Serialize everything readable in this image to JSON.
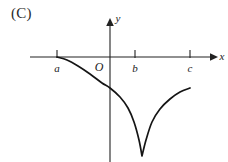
{
  "figure": {
    "choice_label": "(C)",
    "origin_label": "O",
    "x_axis_label": "x",
    "y_axis_label": "y",
    "line_color": "#151515",
    "axis_color": "#222222",
    "background_color": "#ffffff"
  },
  "ticks": {
    "x": [
      {
        "label": "a",
        "px": 57
      },
      {
        "label": "b",
        "px": 135
      },
      {
        "label": "c",
        "px": 190
      }
    ]
  },
  "chart_data": {
    "type": "line",
    "title": "",
    "xlabel": "x",
    "ylabel": "y",
    "grid": false,
    "legend": null,
    "annotations": [
      "(C)",
      "O"
    ],
    "xticks": [
      "a",
      "b",
      "c"
    ],
    "yticks": [],
    "xlim": [
      30,
      215
    ],
    "ylim": [
      162,
      20
    ],
    "series": [
      {
        "name": "curve",
        "points": [
          [
            57,
            57
          ],
          [
            67,
            60
          ],
          [
            78,
            66
          ],
          [
            90,
            74
          ],
          [
            102,
            83
          ],
          [
            110,
            88
          ],
          [
            120,
            97
          ],
          [
            128,
            108
          ],
          [
            134,
            122
          ],
          [
            139,
            140
          ],
          [
            142,
            156
          ],
          [
            146,
            140
          ],
          [
            152,
            122
          ],
          [
            160,
            109
          ],
          [
            170,
            99
          ],
          [
            180,
            92
          ],
          [
            190,
            88
          ]
        ]
      }
    ]
  }
}
